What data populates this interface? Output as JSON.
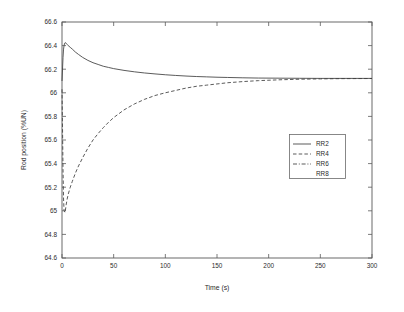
{
  "chart_data": {
    "type": "line",
    "title": "",
    "xlabel": "Time (s)",
    "ylabel": "Rod position (%UN)",
    "xlim": [
      0,
      300
    ],
    "ylim": [
      64.6,
      66.6
    ],
    "xticks": [
      0,
      50,
      100,
      150,
      200,
      250,
      300
    ],
    "xtick_labels": [
      "0",
      "50",
      "100",
      "150",
      "200",
      "250",
      "300"
    ],
    "yticks": [
      64.6,
      64.8,
      65,
      65.2,
      65.4,
      65.6,
      65.8,
      66,
      66.2,
      66.4,
      66.6
    ],
    "ytick_labels": [
      "64.6",
      "64.8",
      "65",
      "65.2",
      "65.4",
      "65.6",
      "65.8",
      "66",
      "66.2",
      "66.4",
      "66.6"
    ],
    "grid": false,
    "legend_position": "center-right",
    "legend_entries": [
      "RR2",
      "RR4",
      "RR6",
      "RR8"
    ],
    "series": [
      {
        "name": "RR2",
        "style": "solid",
        "x": [
          0,
          0.5,
          1,
          1.5,
          2,
          2.5,
          3,
          4,
          5,
          6,
          8,
          10,
          13,
          16,
          20,
          25,
          30,
          35,
          40,
          45,
          50,
          60,
          70,
          80,
          90,
          100,
          110,
          120,
          130,
          140,
          150,
          160,
          175,
          190,
          210,
          230,
          250,
          270,
          300
        ],
        "y": [
          66.1,
          66.2,
          66.3,
          66.37,
          66.4,
          66.42,
          66.425,
          66.42,
          66.41,
          66.4,
          66.385,
          66.37,
          66.345,
          66.325,
          66.3,
          66.275,
          66.255,
          66.24,
          66.225,
          66.215,
          66.205,
          66.19,
          66.178,
          66.168,
          66.16,
          66.153,
          66.147,
          66.142,
          66.138,
          66.135,
          66.132,
          66.13,
          66.127,
          66.125,
          66.124,
          66.123,
          66.122,
          66.122,
          66.122
        ]
      },
      {
        "name": "RR4",
        "style": "dashed",
        "x": [
          0,
          0.5,
          1,
          1.5,
          2,
          3,
          4,
          5,
          6,
          8,
          10,
          13,
          16,
          20,
          25,
          30,
          35,
          40,
          45,
          50,
          60,
          70,
          80,
          90,
          100,
          110,
          120,
          130,
          140,
          150,
          160,
          175,
          190,
          210,
          230,
          250,
          270,
          300
        ],
        "y": [
          66.03,
          65.7,
          65.35,
          65.1,
          65.0,
          64.985,
          65.05,
          65.1,
          65.14,
          65.2,
          65.25,
          65.32,
          65.38,
          65.45,
          65.53,
          65.6,
          65.655,
          65.705,
          65.75,
          65.79,
          65.855,
          65.905,
          65.945,
          65.977,
          66.0,
          66.02,
          66.04,
          66.055,
          66.065,
          66.075,
          66.085,
          66.095,
          66.103,
          66.11,
          66.115,
          66.118,
          66.12,
          66.121
        ]
      }
    ]
  },
  "axes": {
    "ylabel": "Rod position (%UN)",
    "xlabel": "Time (s)"
  },
  "legend": {
    "items": [
      {
        "label": "RR2",
        "style": "solid"
      },
      {
        "label": "RR4",
        "style": "dashed"
      },
      {
        "label": "RR6",
        "style": "dashdot"
      },
      {
        "label": "RR8",
        "style": "none"
      }
    ]
  }
}
